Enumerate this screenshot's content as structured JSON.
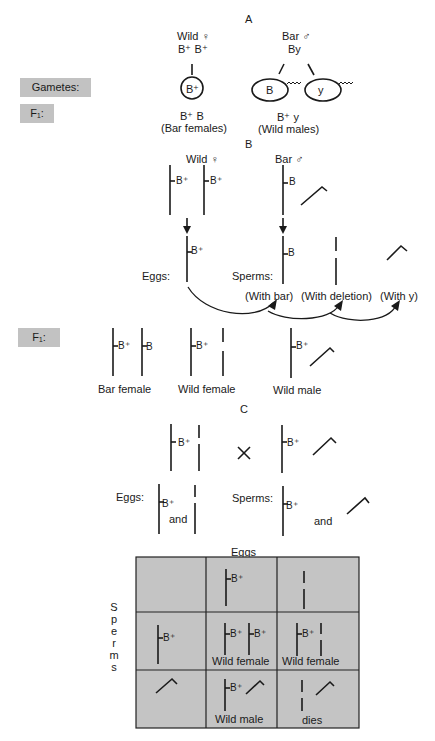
{
  "section_a": {
    "heading": "A",
    "female": {
      "title": "Wild ♀",
      "genotype": "B⁺  B⁺",
      "gamete": "B⁺"
    },
    "male": {
      "title": "Bar ♂",
      "genotype": "By",
      "gametes": [
        "B",
        "y"
      ]
    },
    "f1_female": {
      "genotype": "B⁺  B",
      "phenotype": "(Bar females)"
    },
    "f1_male": {
      "genotype": "B⁺  y",
      "phenotype": "(Wild males)"
    }
  },
  "side_labels": {
    "gametes": "Gametes:",
    "f1_top": "F₁:",
    "f1_mid": "F₁:"
  },
  "section_b": {
    "heading": "B",
    "female_title": "Wild ♀",
    "male_title": "Bar ♂",
    "allele_bplus": "B⁺",
    "allele_b": "B",
    "eggs_label": "Eggs:",
    "sperms_label": "Sperms:",
    "sperm_types": [
      "(With bar)",
      "(With deletion)",
      "(With y)"
    ],
    "f1_types": [
      "Bar  female",
      "Wild female",
      "Wild male"
    ]
  },
  "section_c": {
    "heading": "C",
    "cross_symbol": "×",
    "allele_bplus": "B⁺",
    "eggs_label": "Eggs:",
    "sperms_label": "Sperms:",
    "and_label": "and"
  },
  "punnett": {
    "col_header": "Eggs",
    "row_header_letters": [
      "S",
      "p",
      "e",
      "r",
      "m",
      "s"
    ],
    "allele_bplus": "B⁺",
    "cells": {
      "r1c1": "Wild female",
      "r1c2": "Wild female",
      "r2c1": "Wild male",
      "r2c2": "dies"
    },
    "fill_color": "#c4c4c4"
  }
}
